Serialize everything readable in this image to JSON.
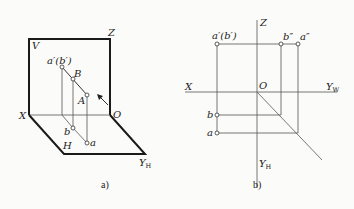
{
  "figure_a": {
    "caption": "a)",
    "plane_labels": {
      "v": "V",
      "h": "H"
    },
    "axis_labels": {
      "z": "Z",
      "x": "X",
      "o": "O",
      "yh": "Y",
      "yh_sub": "H"
    },
    "point_labels": {
      "a_prime_b_prime": "a′(b′)",
      "B": "B",
      "A": "A",
      "b": "b",
      "a": "a"
    }
  },
  "figure_b": {
    "caption": "b)",
    "axis_labels": {
      "z": "Z",
      "x": "X",
      "o": "O",
      "yw": "Y",
      "yw_sub": "W",
      "yh": "Y",
      "yh_sub": "H"
    },
    "point_labels": {
      "a_prime_b_prime": "a′(b′)",
      "b_dprime": "b″",
      "a_dprime": "a″",
      "b": "b",
      "a": "a"
    }
  }
}
